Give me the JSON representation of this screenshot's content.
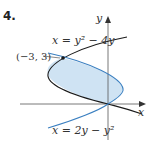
{
  "problem_number": "4.",
  "axes": {
    "x_label": "x",
    "y_label": "y"
  },
  "curves": [
    {
      "name": "black",
      "equation": "x = y² − 4y",
      "color": "#1a1a1a"
    },
    {
      "name": "blue",
      "equation": "x = 2y − y²",
      "color": "#3a7fc0"
    }
  ],
  "region_fill": "#cfe3f3",
  "intersection_label": "(−3, 3)"
}
